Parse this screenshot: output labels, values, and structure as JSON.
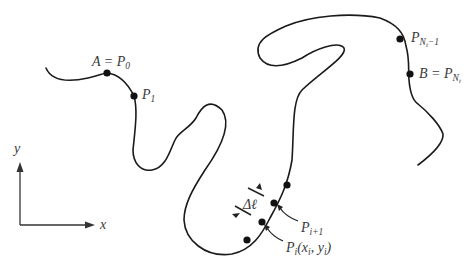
{
  "diagram": {
    "colors": {
      "curve": "#1a1a1a",
      "text": "#3a3a3a",
      "background": "#ffffff"
    },
    "axes": {
      "x_label": "x",
      "y_label": "y"
    },
    "points": {
      "start": {
        "lhs": "A",
        "eq": " = ",
        "name": "P",
        "sub": "0"
      },
      "p1": {
        "name": "P",
        "sub": "1"
      },
      "pn_minus_1": {
        "name": "P",
        "sub": "N",
        "subsub": "t",
        "tail": "−1"
      },
      "end": {
        "lhs": "B",
        "eq": " = ",
        "name": "P",
        "sub": "N",
        "subsub": "t"
      },
      "p_i_plus_1": {
        "name": "P",
        "sub": "i+1"
      },
      "p_i": {
        "name": "P",
        "sub": "i",
        "args_open": "(x",
        "arg1_sub": "i",
        "sep": ", y",
        "arg2_sub": "i",
        "args_close": ")"
      }
    },
    "segment_length": {
      "symbol": "Δℓ"
    }
  }
}
